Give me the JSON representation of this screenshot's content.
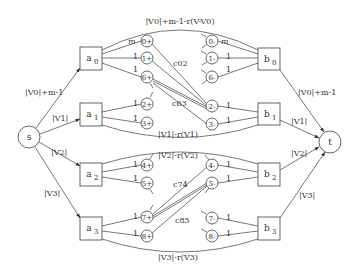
{
  "diagram": {
    "source": {
      "id": "s",
      "label": "s"
    },
    "sink": {
      "id": "t",
      "label": "t"
    },
    "a_nodes": [
      {
        "id": "a0",
        "label": "a",
        "sub": "0"
      },
      {
        "id": "a1",
        "label": "a",
        "sub": "1"
      },
      {
        "id": "a2",
        "label": "a",
        "sub": "2"
      },
      {
        "id": "a3",
        "label": "a",
        "sub": "3"
      }
    ],
    "b_nodes": [
      {
        "id": "b0",
        "label": "b",
        "sub": "0"
      },
      {
        "id": "b1",
        "label": "b",
        "sub": "1"
      },
      {
        "id": "b2",
        "label": "b",
        "sub": "2"
      },
      {
        "id": "b3",
        "label": "b",
        "sub": "3"
      }
    ],
    "plus_nodes": [
      "0+",
      "1+",
      "6+",
      "2+",
      "3+",
      "4+",
      "5+",
      "7+",
      "8+"
    ],
    "minus_nodes": [
      "0-",
      "1-",
      "6-",
      "2-",
      "3-",
      "4-",
      "5-",
      "7-",
      "8-"
    ],
    "source_edges": [
      "|V0|+m-1",
      "|V1|",
      "|V2|",
      "|V3|"
    ],
    "sink_edges": [
      "|V0|+m-1",
      "|V1|",
      "|V2|",
      "|V3|"
    ],
    "bypass_edges": [
      "|V0|+m-1-r(V-V0)",
      "|V1|-r(V1)",
      "|V2|-r(V2)",
      "|V3|-r(V3)"
    ],
    "unit_edge_labels": {
      "m": "m",
      "one": "1"
    },
    "cross_labels": [
      "c02",
      "c63",
      "c74",
      "c85"
    ]
  }
}
